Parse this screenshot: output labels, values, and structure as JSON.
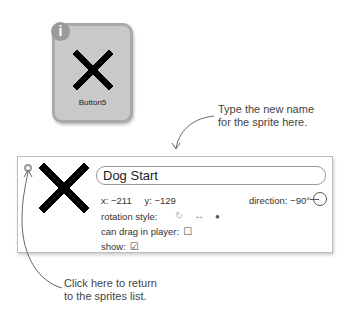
{
  "sprite_card": {
    "info_icon": "i",
    "costume_icon": "x-cross-costume",
    "label": "Button5"
  },
  "callouts": {
    "rename_line1": "Type the new name",
    "rename_line2": "for the sprite here.",
    "back_line1": "Click here to return",
    "back_line2": "to the sprites list."
  },
  "info_panel": {
    "sprite_name": "Dog Start",
    "x_label": "x: −211",
    "y_label": "y: −129",
    "direction_label": "direction: −90°",
    "rotation_style_label": "rotation style:",
    "rotation_options": [
      "↻",
      "↔",
      "●"
    ],
    "can_drag_label": "can drag in player:",
    "can_drag_value": "☐",
    "show_label": "show:",
    "show_value": "☑"
  },
  "colors": {
    "card_bg": "#c9c9c9",
    "card_border": "#a9a9a9",
    "badge": "#9a9a9a",
    "panel_border": "#bdbdbd"
  }
}
